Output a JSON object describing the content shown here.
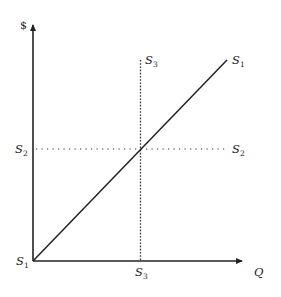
{
  "diagram": {
    "type": "supply-curves",
    "axes": {
      "y_label": "$",
      "x_label": "Q",
      "color": "#222222"
    },
    "origin_label": {
      "main": "S",
      "sub": "1"
    },
    "curves": [
      {
        "name": "S1",
        "style": "solid",
        "label": {
          "main": "S",
          "sub": "1"
        },
        "description": "upward-sloping line from origin"
      },
      {
        "name": "S2",
        "style": "dotted",
        "label_left": {
          "main": "S",
          "sub": "2"
        },
        "label_right": {
          "main": "S",
          "sub": "2"
        },
        "description": "horizontal line (perfectly elastic)"
      },
      {
        "name": "S3",
        "style": "dotted",
        "label_top": {
          "main": "S",
          "sub": "3"
        },
        "label_bottom": {
          "main": "S",
          "sub": "3"
        },
        "description": "vertical line (perfectly inelastic)"
      }
    ]
  }
}
